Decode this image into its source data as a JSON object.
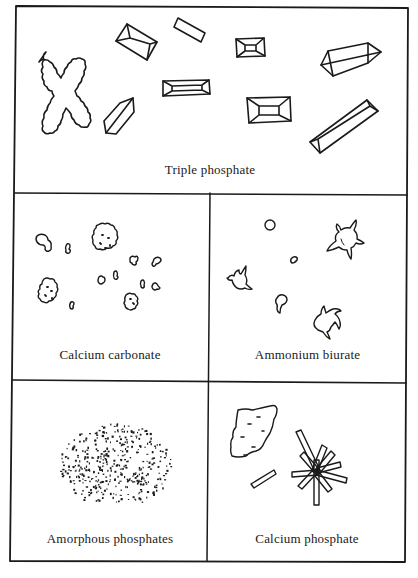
{
  "figure": {
    "panels": [
      {
        "id": "triple-phosphate",
        "label": "Triple phosphate"
      },
      {
        "id": "calcium-carbonate",
        "label": "Calcium carbonate"
      },
      {
        "id": "ammonium-biurate",
        "label": "Ammonium biurate"
      },
      {
        "id": "amorphous-phosphates",
        "label": "Amorphous phosphates"
      },
      {
        "id": "calcium-phosphate",
        "label": "Calcium phosphate"
      }
    ]
  },
  "colors": {
    "line": "#1a1a1a",
    "background": "#ffffff"
  }
}
